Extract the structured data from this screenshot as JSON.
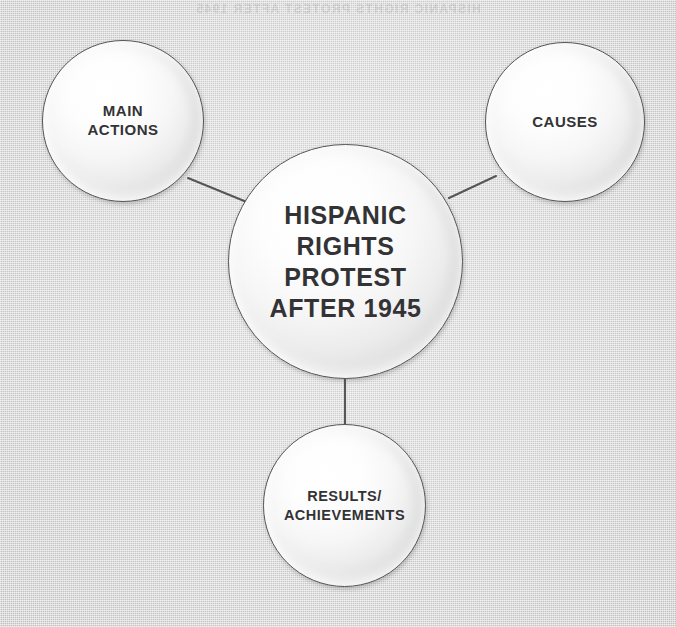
{
  "diagram": {
    "type": "concept-map",
    "layout": "hub-and-spoke",
    "background_color": "#c8c8c8",
    "node_fill_color": "#f5f5f5",
    "node_stroke_color": "#55565a",
    "text_color": "#333336",
    "ghost_text": "HISPANIC RIGHTS PROTEST AFTER 1945",
    "center": {
      "id": "center",
      "label": "HISPANIC\nRIGHTS\nPROTEST\nAFTER 1945",
      "label_lines": [
        "HISPANIC",
        "RIGHTS",
        "PROTEST",
        "AFTER 1945"
      ],
      "cx": 345,
      "cy": 261,
      "r": 117
    },
    "satellites": [
      {
        "id": "main-actions",
        "label": "MAIN\nACTIONS",
        "label_lines": [
          "MAIN",
          "ACTIONS"
        ],
        "cx": 123,
        "cy": 121,
        "r": 81,
        "position": "top-left"
      },
      {
        "id": "causes",
        "label": "CAUSES",
        "label_lines": [
          "CAUSES"
        ],
        "cx": 565,
        "cy": 122,
        "r": 80,
        "position": "top-right"
      },
      {
        "id": "results-achievements",
        "label": "RESULTS/\nACHIEVEMENTS",
        "label_lines": [
          "RESULTS/",
          "ACHIEVEMENTS"
        ],
        "cx": 344,
        "cy": 506,
        "r": 81,
        "position": "bottom"
      }
    ],
    "connectors": [
      {
        "id": "center-to-main-actions",
        "from": "center",
        "to": "main-actions",
        "x1": 254,
        "y1": 205,
        "x2": 188,
        "y2": 178
      },
      {
        "id": "center-to-causes",
        "from": "center",
        "to": "causes",
        "x1": 449,
        "y1": 198,
        "x2": 496,
        "y2": 176
      },
      {
        "id": "center-to-results",
        "from": "center",
        "to": "results-achievements",
        "x1": 345,
        "y1": 379,
        "x2": 345,
        "y2": 424
      }
    ]
  }
}
